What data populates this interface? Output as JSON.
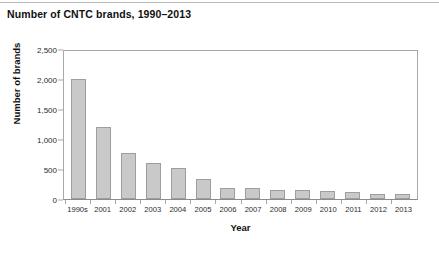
{
  "figure": {
    "title": "Number of CNTC brands, 1990–2013",
    "background_color": "#ffffff",
    "has_top_rule": true
  },
  "chart_data": {
    "type": "bar",
    "title": "Number of CNTC brands, 1990–2013",
    "xlabel": "Year",
    "ylabel": "Number of brands",
    "categories": [
      "1990s",
      "2001",
      "2002",
      "2003",
      "2004",
      "2005",
      "2006",
      "2007",
      "2008",
      "2009",
      "2010",
      "2011",
      "2012",
      "2013"
    ],
    "values": [
      2000,
      1200,
      760,
      600,
      510,
      330,
      180,
      185,
      155,
      150,
      130,
      120,
      90,
      80
    ],
    "ylim": [
      0,
      2500
    ],
    "ytick_labels": [
      "0",
      "500",
      "1,000",
      "1,500",
      "2,000",
      "2,500"
    ],
    "ytick_values": [
      0,
      500,
      1000,
      1500,
      2000,
      2500
    ],
    "grid": false,
    "legend": "none",
    "bar_fill_color": "#c9c9c9",
    "bar_border_color": "#9e9e9e",
    "axis_color": "#a8a8a8"
  }
}
